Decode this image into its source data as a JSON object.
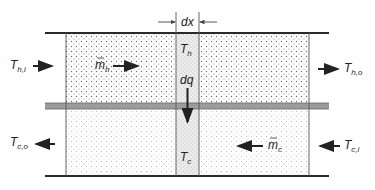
{
  "diagram": {
    "labels": {
      "dx": "dx",
      "T_h": "T",
      "T_h_sub": "h",
      "dq": "dq",
      "T_c": "T",
      "T_c_sub": "c",
      "hot_inlet": "T",
      "hot_inlet_sub": "h,i",
      "hot_outlet": "T",
      "hot_outlet_sub": "h,o",
      "cold_inlet": "T",
      "cold_inlet_sub": "c,i",
      "cold_outlet": "T",
      "cold_outlet_sub": "c,o",
      "m_h": "m",
      "m_h_sub": "h",
      "m_c": "m",
      "m_c_sub": "c"
    },
    "colors": {
      "line": "#2a2a2a",
      "wall": "#9a9a9a",
      "hot_dots": "#7a7a7a",
      "cold_dots": "#b0b0b0",
      "strip_bg": "#ececec"
    },
    "flows": {
      "hot_direction": "left-to-right",
      "cold_direction": "right-to-left",
      "heat_flow": "downward"
    }
  }
}
